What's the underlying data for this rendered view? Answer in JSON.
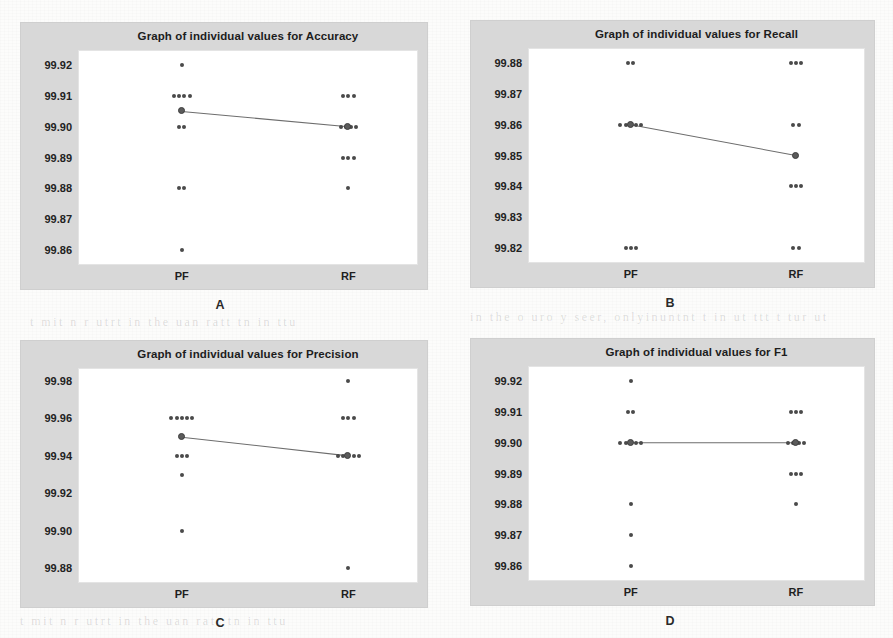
{
  "figure": {
    "panel_letters": [
      "A",
      "B",
      "C",
      "D"
    ],
    "group_labels": [
      "PF",
      "RF"
    ],
    "dot_color": "#4a4a4a",
    "mean_color": "#5b5b5b",
    "panel_bg": "#d8d8d8",
    "plot_bg": "#ffffff",
    "page_bg": "#fcfcfb"
  },
  "ghost_text": [
    "in the nuon is a sub inter unit the the ann",
    "tuur in  t mnt  ti itr  tin  anta  tn  u tn",
    "ht tr itur  au  uit  nin  itu  ann  utat it",
    "tin t inar utto un   rtt  iut  ntan tuit tn",
    "t mit n r utrt in the uan ratt tn  in  ttu",
    "in the o uro y seer, onlyinuntnt t  in  ut ttt  t tur  ut"
  ],
  "chart_data": [
    {
      "id": "panel-a",
      "letter": "A",
      "type": "scatter",
      "title": "Graph of individual values for Accuracy",
      "xlabel": "",
      "ylabel": "",
      "categories": [
        "PF",
        "RF"
      ],
      "yticks": [
        "99.92",
        "99.91",
        "99.90",
        "99.89",
        "99.88",
        "99.87",
        "99.86"
      ],
      "ytick_values": [
        99.92,
        99.91,
        99.9,
        99.89,
        99.88,
        99.87,
        99.86
      ],
      "ylim": [
        99.855,
        99.925
      ],
      "grid": false,
      "legend": "none",
      "series": [
        {
          "name": "PF",
          "values": [
            99.92,
            99.91,
            99.91,
            99.91,
            99.91,
            99.9,
            99.9,
            99.88,
            99.88,
            99.86
          ]
        },
        {
          "name": "RF",
          "values": [
            99.91,
            99.91,
            99.91,
            99.9,
            99.9,
            99.9,
            99.9,
            99.89,
            99.89,
            99.89,
            99.88
          ]
        }
      ],
      "means": [
        99.905,
        99.9
      ],
      "mean_line": true
    },
    {
      "id": "panel-b",
      "letter": "B",
      "type": "scatter",
      "title": "Graph of individual values for Recall",
      "xlabel": "",
      "ylabel": "",
      "categories": [
        "PF",
        "RF"
      ],
      "yticks": [
        "99.88",
        "99.87",
        "99.86",
        "99.85",
        "99.84",
        "99.83",
        "99.82"
      ],
      "ytick_values": [
        99.88,
        99.87,
        99.86,
        99.85,
        99.84,
        99.83,
        99.82
      ],
      "ylim": [
        99.815,
        99.885
      ],
      "grid": false,
      "legend": "none",
      "series": [
        {
          "name": "PF",
          "values": [
            99.88,
            99.88,
            99.86,
            99.86,
            99.86,
            99.86,
            99.86,
            99.82,
            99.82,
            99.82
          ]
        },
        {
          "name": "RF",
          "values": [
            99.88,
            99.88,
            99.88,
            99.86,
            99.86,
            99.85,
            99.84,
            99.84,
            99.84,
            99.82,
            99.82
          ]
        }
      ],
      "means": [
        99.86,
        99.85
      ],
      "mean_line": true
    },
    {
      "id": "panel-c",
      "letter": "C",
      "type": "scatter",
      "title": "Graph of individual values for Precision",
      "xlabel": "",
      "ylabel": "",
      "categories": [
        "PF",
        "RF"
      ],
      "yticks": [
        "99.98",
        "99.96",
        "99.94",
        "99.92",
        "99.90",
        "99.88"
      ],
      "ytick_values": [
        99.98,
        99.96,
        99.94,
        99.92,
        99.9,
        99.88
      ],
      "ylim": [
        99.872,
        99.987
      ],
      "grid": false,
      "legend": "none",
      "series": [
        {
          "name": "PF",
          "values": [
            99.96,
            99.96,
            99.96,
            99.96,
            99.96,
            99.94,
            99.94,
            99.94,
            99.93,
            99.9
          ]
        },
        {
          "name": "RF",
          "values": [
            99.98,
            99.96,
            99.96,
            99.96,
            99.94,
            99.94,
            99.94,
            99.94,
            99.94,
            99.88
          ]
        }
      ],
      "means": [
        99.95,
        99.94
      ],
      "mean_line": true
    },
    {
      "id": "panel-d",
      "letter": "D",
      "type": "scatter",
      "title": "Graph of individual values for F1",
      "xlabel": "",
      "ylabel": "",
      "categories": [
        "PF",
        "RF"
      ],
      "yticks": [
        "99.92",
        "99.91",
        "99.90",
        "99.89",
        "99.88",
        "99.87",
        "99.86"
      ],
      "ytick_values": [
        99.92,
        99.91,
        99.9,
        99.89,
        99.88,
        99.87,
        99.86
      ],
      "ylim": [
        99.855,
        99.925
      ],
      "grid": false,
      "legend": "none",
      "series": [
        {
          "name": "PF",
          "values": [
            99.92,
            99.91,
            99.91,
            99.9,
            99.9,
            99.9,
            99.9,
            99.9,
            99.88,
            99.87,
            99.86
          ]
        },
        {
          "name": "RF",
          "values": [
            99.91,
            99.91,
            99.91,
            99.9,
            99.9,
            99.9,
            99.9,
            99.89,
            99.89,
            99.89,
            99.88
          ]
        }
      ],
      "means": [
        99.9,
        99.9
      ],
      "mean_line": true
    }
  ]
}
